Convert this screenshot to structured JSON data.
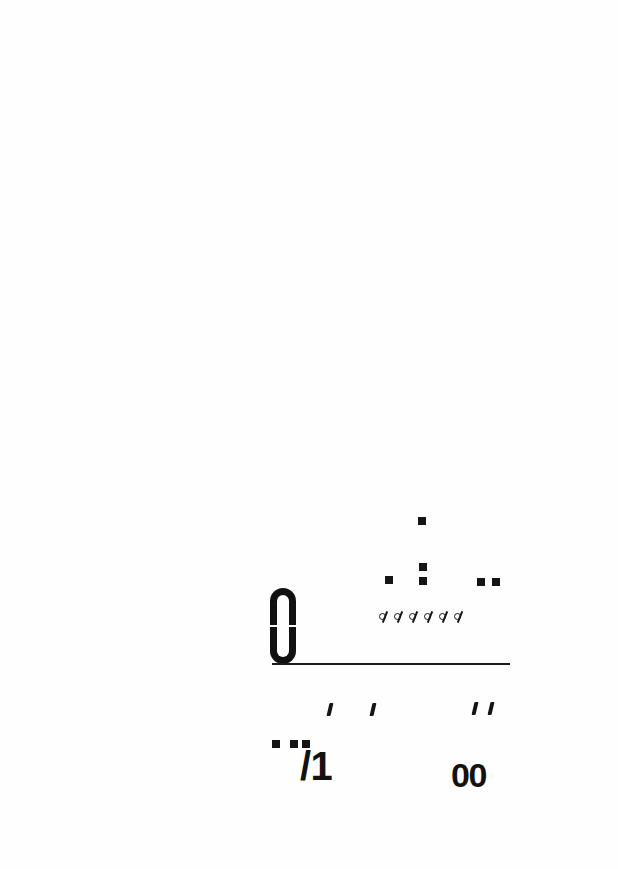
{
  "page": {
    "kind": "scanned-document-page",
    "width": 618,
    "height": 869,
    "background_color": "#fefefe",
    "ink_color": "#141414"
  },
  "fragments": {
    "stack_glyph": {
      "label": "∩∪",
      "name": "stacked-cap-cup-glyph"
    },
    "square_marks": [
      {
        "x": 418,
        "y": 517,
        "size": 8,
        "name": "period-mark-top"
      },
      {
        "x": 385,
        "y": 576,
        "size": 8,
        "name": "period-mark-left"
      },
      {
        "x": 419,
        "y": 563,
        "size": 8,
        "name": "colon-mark-upper"
      },
      {
        "x": 419,
        "y": 577,
        "size": 8,
        "name": "colon-mark-lower"
      },
      {
        "x": 477,
        "y": 578,
        "size": 8,
        "name": "period-mark-right-a"
      },
      {
        "x": 492,
        "y": 578,
        "size": 8,
        "name": "period-mark-right-b"
      }
    ],
    "slashed_o_row": {
      "glyph": "ø",
      "count": 6,
      "name": "slashed-o-row"
    },
    "rule": {
      "name": "horizontal-rule",
      "x": 272,
      "y": 663,
      "width": 238
    },
    "apostrophes": [
      {
        "x": 328,
        "y": 703,
        "name": "apostrophe-1"
      },
      {
        "x": 371,
        "y": 703,
        "name": "apostrophe-2"
      },
      {
        "x": 473,
        "y": 702,
        "name": "apostrophe-3"
      },
      {
        "x": 489,
        "y": 702,
        "name": "apostrophe-4"
      }
    ],
    "bottom_dots": [
      {
        "x": 272,
        "y": 740,
        "size": 8,
        "name": "bottom-dot-1"
      },
      {
        "x": 290,
        "y": 740,
        "size": 8,
        "name": "bottom-dot-2"
      },
      {
        "x": 302,
        "y": 740,
        "size": 8,
        "name": "bottom-dot-3"
      }
    ],
    "slash_one": {
      "text": "/1",
      "name": "slash-one-fragment"
    },
    "double_zero": {
      "text": "00",
      "name": "double-zero-fragment"
    }
  }
}
